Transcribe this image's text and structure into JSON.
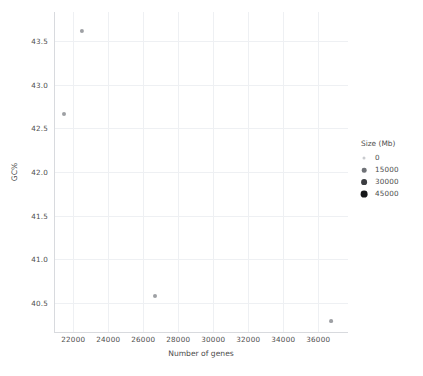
{
  "chart_data": {
    "type": "scatter",
    "title": "",
    "xlabel": "Number of genes",
    "ylabel": "GC%",
    "xlim": [
      20900,
      37700
    ],
    "ylim": [
      40.17,
      43.83
    ],
    "grid": true,
    "xticks": [
      "22000",
      "24000",
      "26000",
      "28000",
      "30000",
      "32000",
      "34000",
      "36000"
    ],
    "xtick_values": [
      22000,
      24000,
      26000,
      28000,
      30000,
      32000,
      34000,
      36000
    ],
    "yticks": [
      "43.5",
      "43.0",
      "42.5",
      "42.0",
      "41.5",
      "41.0",
      "40.5"
    ],
    "ytick_values": [
      43.5,
      43.0,
      42.5,
      42.0,
      41.5,
      41.0,
      40.5
    ],
    "points": [
      {
        "x": 22300,
        "y": 43.69,
        "size": 1100,
        "px": 82,
        "py": 31,
        "r": 2.1
      },
      {
        "x": 21100,
        "y": 42.7,
        "size": 900,
        "px": 64,
        "py": 114,
        "r": 2.0
      },
      {
        "x": 26500,
        "y": 40.53,
        "size": 800,
        "px": 155,
        "py": 296,
        "r": 2.0
      },
      {
        "x": 36800,
        "y": 40.25,
        "size": 700,
        "px": 331,
        "py": 321,
        "r": 1.9
      }
    ],
    "legend": {
      "title": "Size (Mb)",
      "position": "right",
      "entries": [
        {
          "label": "0",
          "value": 0,
          "radius": 1.5,
          "color": "#c9cbcf"
        },
        {
          "label": "15000",
          "value": 15000,
          "radius": 2.3,
          "color": "#6f7277"
        },
        {
          "label": "30000",
          "value": 30000,
          "radius": 2.9,
          "color": "#3b3d41"
        },
        {
          "label": "45000",
          "value": 45000,
          "radius": 3.4,
          "color": "#17181a"
        }
      ]
    },
    "colors": {
      "background": "#ffffff",
      "grid": "#eef0f3",
      "axis": "#d8dade",
      "text": "#4d4d4d",
      "point": "#8d8f94"
    }
  }
}
